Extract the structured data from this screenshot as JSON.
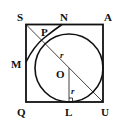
{
  "diagram": {
    "type": "geometry",
    "colors": {
      "stroke": "#111111",
      "background": "#ffffff"
    },
    "labels": {
      "S": "S",
      "N": "N",
      "A": "A",
      "M": "M",
      "P": "P",
      "O": "O",
      "Q": "Q",
      "L": "L",
      "U": "U",
      "r1": "r",
      "r2": "r"
    }
  }
}
